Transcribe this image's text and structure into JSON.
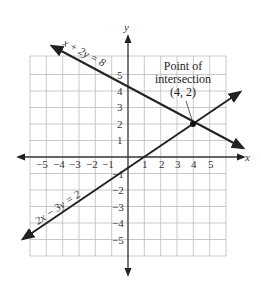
{
  "diagram": {
    "type": "coordinate-graph",
    "axes": {
      "x_label": "x",
      "y_label": "y"
    },
    "x_ticks": [
      "−5",
      "−4",
      "−3",
      "−2",
      "−1",
      "1",
      "2",
      "3",
      "4",
      "5"
    ],
    "y_ticks": [
      "5",
      "4",
      "3",
      "2",
      "1",
      "−1",
      "−2",
      "−3",
      "−4",
      "−5"
    ],
    "lines": [
      {
        "equation": "x + 2y = 8"
      },
      {
        "equation": "2x − 3y = 2"
      }
    ],
    "annotation": {
      "line1": "Point of",
      "line2": "intersection",
      "line3": "(4, 2)"
    },
    "intersection": {
      "x": 4,
      "y": 2
    }
  }
}
